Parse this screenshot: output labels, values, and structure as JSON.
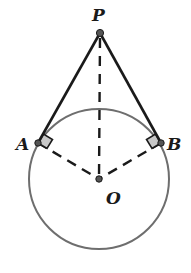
{
  "diagram": {
    "type": "geometry",
    "points": {
      "P": {
        "label": "P",
        "x": 100,
        "y": 33
      },
      "A": {
        "label": "A",
        "x": 38,
        "y": 143
      },
      "B": {
        "label": "B",
        "x": 161,
        "y": 143
      },
      "O": {
        "label": "O",
        "x": 99,
        "y": 179
      }
    },
    "circle": {
      "center": "O",
      "cx": 99,
      "cy": 179,
      "r": 70
    },
    "segments": [
      {
        "from": "P",
        "to": "A",
        "style": "solid"
      },
      {
        "from": "P",
        "to": "B",
        "style": "solid"
      },
      {
        "from": "P",
        "to": "O",
        "style": "dashed"
      },
      {
        "from": "A",
        "to": "O",
        "style": "dashed"
      },
      {
        "from": "B",
        "to": "O",
        "style": "dashed"
      }
    ],
    "right_angle_marks": [
      "A",
      "B"
    ],
    "colors": {
      "line": "#1a1a1a",
      "circle": "#6e6e6e",
      "point": "#555555",
      "right_angle_fill": "#c8c8c8"
    }
  }
}
